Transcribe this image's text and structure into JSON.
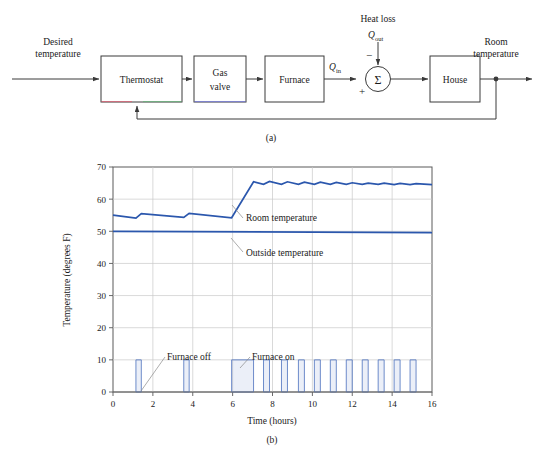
{
  "figure": {
    "caption_a": "(a)",
    "caption_b": "(b)"
  },
  "block_diagram": {
    "input_label_line1": "Desired",
    "input_label_line2": "temperature",
    "output_label_line1": "Room",
    "output_label_line2": "temperature",
    "disturbance_label": "Heat loss",
    "disturbance_symbol_base": "Q",
    "disturbance_symbol_sub": "out",
    "heat_in_symbol_base": "Q",
    "heat_in_symbol_sub": "in",
    "summation_glyph": "Σ",
    "sign_negative": "−",
    "sign_positive": "+",
    "blocks": [
      {
        "id": "thermostat",
        "label_line1": "Thermostat",
        "label_line2": ""
      },
      {
        "id": "gas-valve",
        "label_line1": "Gas",
        "label_line2": "valve"
      },
      {
        "id": "furnace",
        "label_line1": "Furnace",
        "label_line2": ""
      },
      {
        "id": "house",
        "label_line1": "House",
        "label_line2": ""
      }
    ]
  },
  "chart_data": {
    "type": "line",
    "title": "",
    "xlabel": "Time (hours)",
    "ylabel": "Temperature (degrees F)",
    "xlim": [
      0,
      16
    ],
    "ylim": [
      0,
      70
    ],
    "xticks": [
      0,
      2,
      4,
      6,
      8,
      10,
      12,
      14,
      16
    ],
    "xtick_labels": [
      "0",
      "2",
      "4",
      "6",
      "8",
      "10",
      "12",
      "14",
      "16"
    ],
    "yticks": [
      0,
      10,
      20,
      30,
      40,
      50,
      60,
      70
    ],
    "ytick_labels": [
      "0",
      "10",
      "20",
      "30",
      "40",
      "50",
      "60",
      "70"
    ],
    "grid": true,
    "legend_position": "inline-annotations",
    "colors": {
      "room": "#2b57ad",
      "outside": "#2b57ad",
      "pulse_stroke": "#5d7fc4",
      "pulse_fill": "#8fa8d8",
      "grid": "#c8c8c8",
      "axis": "#5a5a5a",
      "text": "#1a1a1a"
    },
    "annotations": [
      {
        "name": "room-temperature-label",
        "text": "Room temperature",
        "x": 7.3,
        "y": 57.5
      },
      {
        "name": "outside-temperature-label",
        "text": "Outside temperature",
        "x": 7.3,
        "y": 46.5
      },
      {
        "name": "furnace-off-label",
        "text": "Furnace off",
        "x": 4.2,
        "y": 13.2
      },
      {
        "name": "furnace-on-label",
        "text": "Furnace on",
        "x": 8.0,
        "y": 13.2
      }
    ],
    "series": [
      {
        "name": "Room temperature",
        "color": "#2b57ad",
        "x": [
          0.0,
          1.15,
          1.15,
          1.42,
          1.42,
          3.55,
          3.55,
          3.82,
          3.82,
          5.95,
          5.95,
          7.05,
          7.05,
          7.55,
          7.55,
          7.85,
          7.85,
          8.45,
          8.45,
          8.75,
          8.75,
          9.3,
          9.3,
          9.6,
          9.6,
          10.1,
          10.1,
          10.4,
          10.4,
          10.9,
          10.9,
          11.2,
          11.2,
          11.7,
          11.7,
          12.0,
          12.0,
          12.5,
          12.5,
          12.8,
          12.8,
          13.3,
          13.3,
          13.6,
          13.6,
          14.1,
          14.1,
          14.4,
          14.4,
          14.9,
          14.9,
          15.2,
          15.2,
          16.0
        ],
        "y": [
          55.0,
          54.1,
          54.1,
          55.5,
          55.5,
          54.3,
          54.3,
          55.6,
          55.6,
          54.2,
          54.2,
          65.4,
          65.4,
          64.6,
          64.6,
          65.5,
          65.5,
          64.6,
          64.6,
          65.4,
          65.4,
          64.6,
          64.6,
          65.3,
          65.3,
          64.6,
          64.6,
          65.3,
          65.3,
          64.6,
          64.6,
          65.2,
          65.2,
          64.6,
          64.6,
          65.1,
          65.1,
          64.6,
          64.6,
          65.0,
          65.0,
          64.6,
          64.6,
          65.0,
          65.0,
          64.5,
          64.5,
          64.9,
          64.9,
          64.5,
          64.5,
          64.8,
          64.8,
          64.5
        ],
        "note": "Room temperature rises on a ramp between t=5.95 and t=7.05 then oscillates in a sawtooth about 65 degrees F"
      },
      {
        "name": "Outside temperature",
        "color": "#2b57ad",
        "x": [
          0.0,
          16.0
        ],
        "y": [
          50.0,
          49.6
        ]
      }
    ],
    "furnace_pulses": {
      "name": "Furnace command",
      "on_value": 10,
      "off_value": 0,
      "color": "#5d7fc4",
      "intervals": [
        [
          1.15,
          1.42
        ],
        [
          3.55,
          3.82
        ],
        [
          5.95,
          7.05
        ],
        [
          7.55,
          7.85
        ],
        [
          8.45,
          8.75
        ],
        [
          9.3,
          9.6
        ],
        [
          10.1,
          10.4
        ],
        [
          10.9,
          11.2
        ],
        [
          11.7,
          12.0
        ],
        [
          12.5,
          12.8
        ],
        [
          13.3,
          13.6
        ],
        [
          14.1,
          14.4
        ],
        [
          14.9,
          15.2
        ]
      ]
    }
  }
}
